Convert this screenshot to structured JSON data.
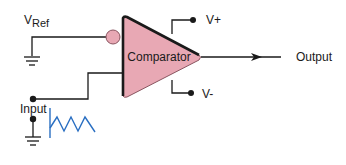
{
  "diagram": {
    "component": {
      "label": "Comparator",
      "fill": "#e8a8b4",
      "stroke": "#1a1a1a"
    },
    "inputs": {
      "reference": {
        "label_main": "V",
        "label_sub": "Ref"
      },
      "signal": {
        "label": "Input"
      }
    },
    "supply": {
      "positive": "V+",
      "negative": "V-"
    },
    "output": {
      "label": "Output"
    },
    "colors": {
      "wire": "#1a1a1a",
      "waveform": "#2a6fc2",
      "bubble": "#e8a8b4"
    }
  }
}
